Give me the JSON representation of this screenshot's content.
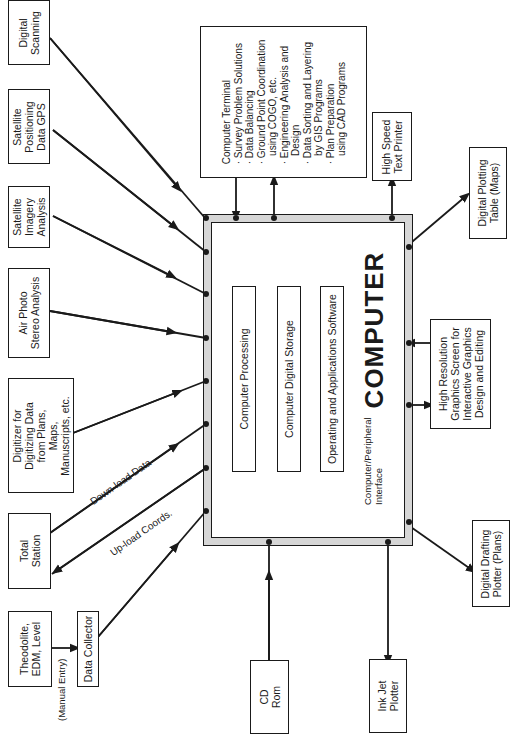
{
  "computer": {
    "title": "COMPUTER",
    "modules": [
      {
        "label": "Computer Processing"
      },
      {
        "label": "Computer Digital Storage"
      },
      {
        "label": "Operating and Applications Software"
      }
    ],
    "interface_label": "Computer/Peripheral\nInterface"
  },
  "inputs": [
    {
      "id": "digital-scanning",
      "label": "Digital\nScanning"
    },
    {
      "id": "satellite-gps",
      "label": "Satellite\nPositioning\nData GPS"
    },
    {
      "id": "satellite-imagery",
      "label": "Satellite\nImagery\nAnalysis"
    },
    {
      "id": "air-photo",
      "label": "Air Photo\nStereo Analysis"
    },
    {
      "id": "digitizer",
      "label": "Digitizer for\nDigitizing Data\nfrom Plans,\nMaps,\nManuscripts, etc."
    },
    {
      "id": "total-station",
      "label": "Total\nStation"
    },
    {
      "id": "theodolite",
      "label": "Theodolite,\nEDM, Level"
    },
    {
      "id": "data-collector",
      "label": "Data Collector"
    },
    {
      "id": "cd-rom",
      "label": "CD\nRom"
    }
  ],
  "outputs": [
    {
      "id": "computer-terminal",
      "label": "Computer Terminal\n· Survey Problem Solutions\n· Data Balancing\n· Ground Point Coordination\n   using COGO, etc.\n· Engineering Analysis and\n   Design\n· Data Sorting and Layering\n   by GIS Programs\n· Plan Preparation\n   using CAD Programs"
    },
    {
      "id": "text-printer",
      "label": "High Speed\nText Printer"
    },
    {
      "id": "plotting-table",
      "label": "Digital Plotting\nTable (Maps)"
    },
    {
      "id": "graphics-screen",
      "label": "High Resolution\nGraphics Screen for\nInteractive Graphics\nDesign and Editing"
    },
    {
      "id": "drafting-plotter",
      "label": "Digital Drafting\nPlotter (Plans)"
    },
    {
      "id": "ink-jet",
      "label": "Ink Jet\nPlotter"
    }
  ],
  "edge_labels": {
    "download": "Down-load Data",
    "upload": "Up-load Coords.",
    "manual": "(Manual Entry)"
  },
  "colors": {
    "ink": "#1a1a1a",
    "hatch": "#d6d6d6",
    "paper": "#ffffff"
  }
}
